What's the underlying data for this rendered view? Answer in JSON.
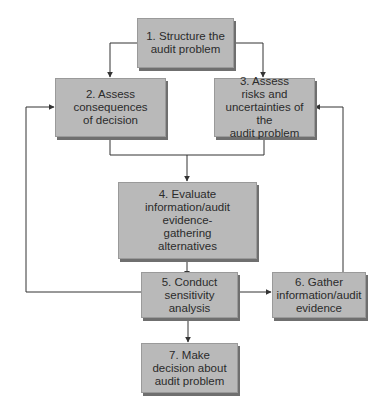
{
  "diagram": {
    "type": "flowchart",
    "colors": {
      "box_fill": "#b9b9b9",
      "box_shadow": "#6f6f6f",
      "line": "#333333",
      "text": "#2b2b2b",
      "background": "#ffffff"
    },
    "nodes": [
      {
        "id": "1",
        "label": "1. Structure the\naudit problem"
      },
      {
        "id": "2",
        "label": "2. Assess\nconsequences\nof decision"
      },
      {
        "id": "3",
        "label": "3. Assess\nrisks and\nuncertainties of the\naudit problem"
      },
      {
        "id": "4",
        "label": "4. Evaluate\ninformation/audit evidence-\ngathering\nalternatives"
      },
      {
        "id": "5",
        "label": "5. Conduct\nsensitivity\nanalysis"
      },
      {
        "id": "6",
        "label": "6. Gather\ninformation/audit\nevidence"
      },
      {
        "id": "7",
        "label": "7. Make\ndecision about\naudit problem"
      }
    ],
    "edges": [
      {
        "from": "1",
        "to": "2"
      },
      {
        "from": "1",
        "to": "3"
      },
      {
        "from": "2",
        "to": "4"
      },
      {
        "from": "3",
        "to": "4"
      },
      {
        "from": "4",
        "to": "5"
      },
      {
        "from": "5",
        "to": "6"
      },
      {
        "from": "5",
        "to": "2"
      },
      {
        "from": "6",
        "to": "3"
      },
      {
        "from": "5",
        "to": "7"
      }
    ]
  }
}
